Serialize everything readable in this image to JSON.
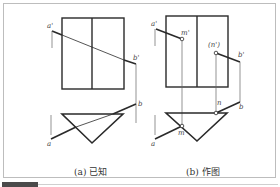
{
  "figure": {
    "panels": [
      {
        "id": "a",
        "caption": "(a) 已知",
        "labels": {
          "a_prime": "a'",
          "b_prime": "b'",
          "a": "a",
          "b": "b"
        }
      },
      {
        "id": "b",
        "caption": "(b) 作图",
        "labels": {
          "a_prime": "a'",
          "b_prime": "b'",
          "m_prime": "m'",
          "n_prime": "(n')",
          "a": "a",
          "b": "b",
          "m": "m",
          "n": "n"
        }
      }
    ]
  }
}
